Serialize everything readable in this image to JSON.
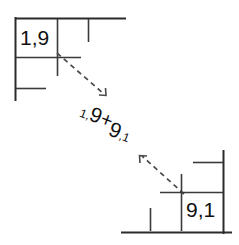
{
  "diagram": {
    "type": "grid-corner-exchange-diagram",
    "background_color": "#ffffff",
    "line_color": "#2b2b2b",
    "arrow_color": "#4a4a4a",
    "text_color": "#111111",
    "top_left_group": {
      "name": "top-left-grid-corner",
      "cell_label": "1,9"
    },
    "bottom_right_group": {
      "name": "bottom-right-grid-corner",
      "cell_label": "9,1"
    },
    "center_label": {
      "full_text": "1,9+9,1",
      "part_small_1": "1,",
      "part_big_1": "9",
      "operator": "+",
      "part_big_2": "9",
      "part_small_2": ",1",
      "rotation_degrees": 21
    },
    "arrows": [
      {
        "name": "arrow-down-right",
        "direction": "down-right",
        "style": "dashed",
        "from": [
          60,
          60
        ],
        "to": [
          106,
          97
        ]
      },
      {
        "name": "arrow-up-left",
        "direction": "up-left",
        "style": "dashed",
        "from": [
          180,
          190
        ],
        "to": [
          140,
          155
        ]
      }
    ]
  }
}
